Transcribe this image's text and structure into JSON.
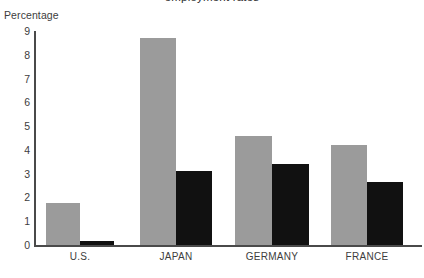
{
  "axis_title": "Percentage",
  "cutoff_title": "employment rates",
  "chart_data": {
    "type": "bar",
    "title": "",
    "xlabel": "",
    "ylabel": "Percentage",
    "ylim": [
      0,
      9
    ],
    "ytick_labels": [
      "9",
      "8",
      "7",
      "6",
      "5",
      "4",
      "3",
      "2",
      "1",
      "0"
    ],
    "ytick_values": [
      9,
      8,
      7,
      6,
      5,
      4,
      3,
      2,
      1,
      0
    ],
    "grid": false,
    "legend": "none",
    "categories": [
      "U.S.",
      "JAPAN",
      "GERMANY",
      "FRANCE"
    ],
    "series": [
      {
        "name": "series-gray",
        "color": "#9b9b9b",
        "values": [
          1.75,
          8.7,
          4.6,
          4.2
        ]
      },
      {
        "name": "series-black",
        "color": "#111111",
        "values": [
          0.15,
          3.1,
          3.4,
          2.65
        ]
      }
    ]
  },
  "colors": {
    "gray": "#9b9b9b",
    "black": "#111111",
    "axis": "#4a4a4a",
    "text": "#3d3d3d",
    "background": "#ffffff"
  }
}
